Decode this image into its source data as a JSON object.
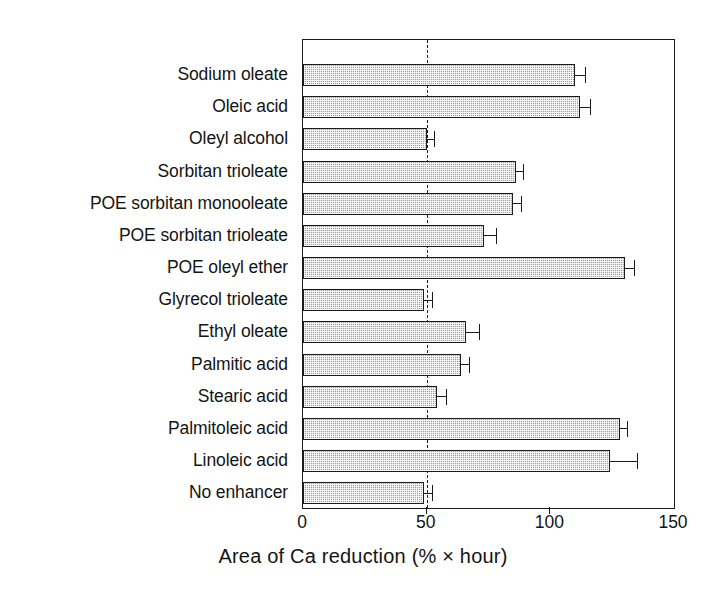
{
  "chart_data": {
    "type": "bar",
    "orientation": "horizontal",
    "title": "",
    "xlabel": "Area of Ca reduction (% × hour)",
    "ylabel": "",
    "xlim": [
      0,
      150
    ],
    "xticks": [
      0,
      50,
      100,
      150
    ],
    "grid": false,
    "legend": null,
    "reference_line": {
      "value": 50,
      "style": "dashed"
    },
    "categories": [
      "Sodium oleate",
      "Oleic acid",
      "Oleyl alcohol",
      "Sorbitan trioleate",
      "POE sorbitan monooleate",
      "POE sorbitan trioleate",
      "POE oleyl ether",
      "Glyrecol trioleate",
      "Ethyl oleate",
      "Palmitic acid",
      "Stearic acid",
      "Palmitoleic acid",
      "Linoleic acid",
      "No enhancer"
    ],
    "values": [
      110,
      112,
      50,
      86,
      85,
      73,
      130,
      49,
      66,
      64,
      54,
      128,
      124,
      49
    ],
    "errors": [
      4,
      4,
      3,
      3,
      3,
      5,
      4,
      3,
      5,
      3,
      4,
      3,
      11,
      3
    ]
  },
  "axis": {
    "tick_labels": [
      "0",
      "50",
      "100",
      "150"
    ],
    "x_axis_title": "Area of Ca reduction (% × hour)"
  },
  "colors": {
    "bar_fill": "#9d9d9d",
    "bar_stroke": "#1c1c1c",
    "axis": "#1a1a1a",
    "text": "#141414",
    "background": "#ffffff"
  }
}
